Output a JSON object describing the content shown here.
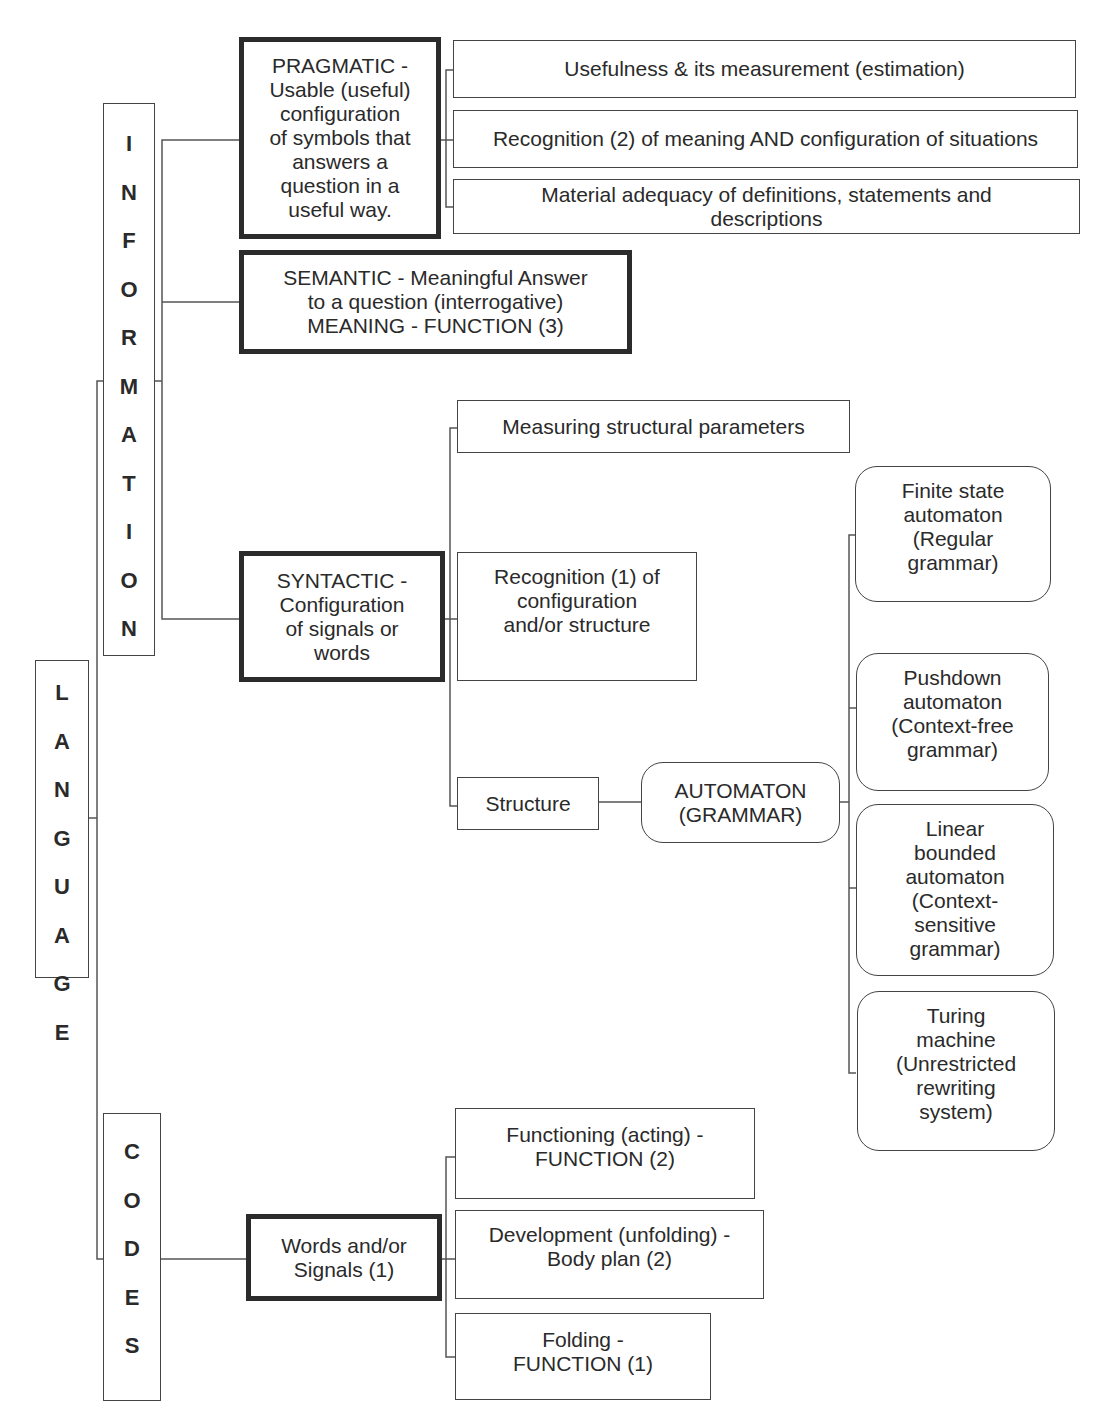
{
  "root": {
    "label": "LANGUAGE",
    "letters": [
      "L",
      "A",
      "N",
      "G",
      "U",
      "A",
      "G",
      "E"
    ]
  },
  "branches": {
    "information": {
      "label": "INFORMATION",
      "letters": [
        "I",
        "N",
        "F",
        "O",
        "R",
        "M",
        "A",
        "T",
        "I",
        "O",
        "N"
      ],
      "pragmatic": {
        "lines": [
          "PRAGMATIC -",
          "Usable (useful)",
          "configuration",
          "of symbols that",
          "answers a",
          "question in a",
          "useful way."
        ],
        "children": [
          {
            "lines": [
              "Usefulness & its measurement (estimation)"
            ]
          },
          {
            "lines": [
              "Recognition (2) of meaning AND configuration of situations"
            ]
          },
          {
            "lines": [
              "Material adequacy of definitions, statements and",
              "descriptions"
            ]
          }
        ]
      },
      "semantic": {
        "lines": [
          "SEMANTIC - Meaningful Answer",
          "to a question (interrogative)",
          "MEANING - FUNCTION (3)"
        ]
      },
      "syntactic": {
        "lines": [
          "SYNTACTIC -",
          "Configuration",
          "of signals or",
          "words"
        ],
        "children": [
          {
            "lines": [
              "Measuring structural parameters"
            ]
          },
          {
            "lines": [
              "Recognition (1) of",
              "configuration",
              "and/or structure"
            ]
          },
          {
            "lines": [
              "Structure"
            ]
          }
        ],
        "automaton": {
          "lines": [
            "AUTOMATON",
            "(GRAMMAR)"
          ],
          "children": [
            {
              "lines": [
                "Finite state",
                "automaton",
                "(Regular",
                "grammar)"
              ]
            },
            {
              "lines": [
                "Pushdown",
                "automaton",
                "(Context-free",
                "grammar)"
              ]
            },
            {
              "lines": [
                "Linear",
                "bounded",
                "automaton",
                "(Context-",
                "sensitive",
                "grammar)"
              ]
            },
            {
              "lines": [
                "Turing",
                "machine",
                "(Unrestricted",
                "rewriting",
                "system)"
              ]
            }
          ]
        }
      }
    },
    "codes": {
      "label": "CODES",
      "letters": [
        "C",
        "O",
        "D",
        "E",
        "S"
      ],
      "words_signals": {
        "lines": [
          "Words and/or",
          "Signals (1)"
        ],
        "children": [
          {
            "lines": [
              "Functioning (acting) -",
              "FUNCTION (2)"
            ]
          },
          {
            "lines": [
              "Development (unfolding) -",
              "Body plan (2)"
            ]
          },
          {
            "lines": [
              "Folding -",
              "FUNCTION (1)"
            ]
          }
        ]
      }
    }
  }
}
